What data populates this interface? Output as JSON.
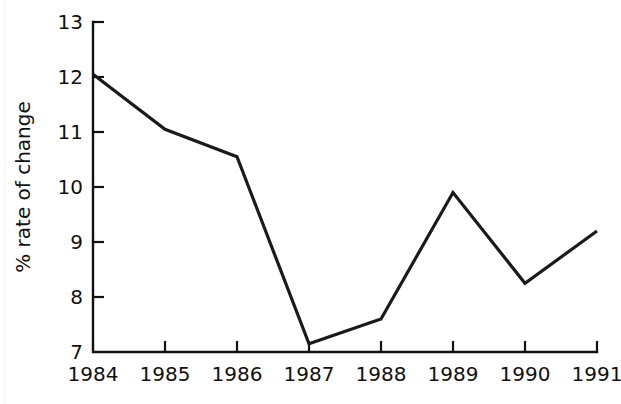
{
  "chart_data": {
    "type": "line",
    "title": "",
    "subtitle": "",
    "xlabel": "",
    "ylabel": "% rate of change",
    "categories": [
      "1984",
      "1985",
      "1986",
      "1987",
      "1988",
      "1989",
      "1990",
      "1991"
    ],
    "values": [
      12.05,
      11.05,
      10.55,
      7.15,
      7.6,
      9.9,
      8.25,
      9.2
    ],
    "series": [
      {
        "name": "% rate of change",
        "values": [
          12.05,
          11.05,
          10.55,
          7.15,
          7.6,
          9.9,
          8.25,
          9.2
        ]
      }
    ],
    "x_tick_labels": [
      "1984",
      "1985",
      "1986",
      "1987",
      "1988",
      "1989",
      "1990",
      "1991"
    ],
    "y_tick_labels": [
      "7",
      "8",
      "9",
      "10",
      "11",
      "12",
      "13"
    ],
    "y_ticks": [
      7,
      8,
      9,
      10,
      11,
      12,
      13
    ],
    "ylim": [
      7,
      13
    ],
    "xlim": [
      1984,
      1991
    ],
    "grid": false,
    "legend": false,
    "legend_position": "none",
    "line_color": "#1a1a1a",
    "axis_color": "#111111",
    "background_color": "#ffffff",
    "tick_direction": "in",
    "annotations": []
  },
  "layout": {
    "width": 621,
    "height": 404,
    "plot_left": 93,
    "plot_right": 597,
    "plot_top": 22,
    "plot_bottom": 352,
    "y_axis_title_x": 30,
    "y_axis_title_y": 187
  }
}
